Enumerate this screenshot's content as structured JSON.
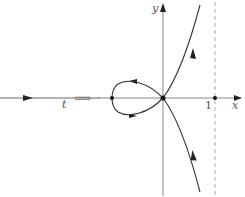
{
  "diagram": {
    "type": "parametrization of nodal cubic curve",
    "left_line": {
      "label": "t"
    },
    "implies_symbol": "⟹",
    "axes": {
      "x_label": "x",
      "y_label": "y"
    },
    "tick_label": "1",
    "asymptote": "vertical dashed line at x = 1",
    "curve": "loop through origin (node) with branches approaching x = 1"
  },
  "colors": {
    "axis": "#999999",
    "curve": "#333333",
    "dashed": "#aaaaaa"
  }
}
